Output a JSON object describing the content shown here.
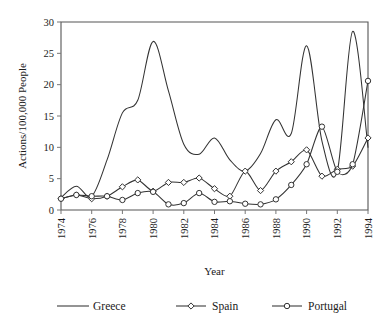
{
  "chart_data": {
    "type": "line",
    "title": "",
    "xlabel": "Year",
    "ylabel": "Actions/100,000 People",
    "xlim": [
      1974,
      1994
    ],
    "ylim": [
      0,
      30
    ],
    "ytick_values": [
      0,
      5,
      10,
      15,
      20,
      25,
      30
    ],
    "ytick_labels": [
      "0",
      "5",
      "10",
      "15",
      "20",
      "25",
      "30"
    ],
    "xtick_values": [
      1974,
      1976,
      1978,
      1980,
      1982,
      1984,
      1986,
      1988,
      1990,
      1992,
      1994
    ],
    "xtick_labels": [
      "1974",
      "1976",
      "1978",
      "1980",
      "1982",
      "1984",
      "1986",
      "1988",
      "1990",
      "1992",
      "1994"
    ],
    "grid": false,
    "legend_position": "bottom",
    "x": [
      1974,
      1975,
      1976,
      1977,
      1978,
      1979,
      1980,
      1981,
      1982,
      1983,
      1984,
      1985,
      1986,
      1987,
      1988,
      1989,
      1990,
      1991,
      1992,
      1993,
      1994
    ],
    "series": [
      {
        "name": "Greece",
        "marker": "none",
        "color": "#333333",
        "values": [
          2.0,
          3.8,
          2.2,
          8.0,
          15.5,
          17.5,
          26.9,
          19.0,
          10.5,
          8.9,
          11.5,
          8.0,
          6.2,
          9.0,
          14.4,
          12.2,
          26.2,
          11.0,
          6.2,
          28.5,
          10.0
        ]
      },
      {
        "name": "Spain",
        "marker": "diamond",
        "color": "#333333",
        "values": [
          1.8,
          2.4,
          1.8,
          2.2,
          3.7,
          4.8,
          3.0,
          4.4,
          4.4,
          5.1,
          3.4,
          2.2,
          6.2,
          3.1,
          6.2,
          7.7,
          9.6,
          5.4,
          6.5,
          7.0,
          11.5
        ]
      },
      {
        "name": "Portugal",
        "marker": "circle",
        "color": "#333333",
        "values": [
          1.8,
          2.4,
          2.2,
          2.2,
          1.6,
          2.7,
          2.9,
          0.9,
          1.1,
          2.7,
          1.3,
          1.4,
          1.0,
          0.9,
          1.7,
          4.0,
          7.3,
          13.3,
          6.1,
          7.3,
          20.6
        ]
      }
    ]
  },
  "legend": {
    "items": [
      {
        "label": "Greece",
        "marker": "none"
      },
      {
        "label": "Spain",
        "marker": "diamond"
      },
      {
        "label": "Portugal",
        "marker": "circle"
      }
    ]
  }
}
